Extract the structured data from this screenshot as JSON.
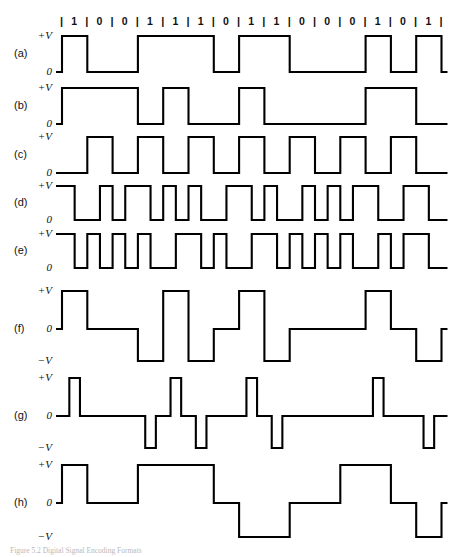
{
  "figure": {
    "caption": "Figure 5.2  Digital Signal Encoding Formats",
    "bit_sequence": [
      1,
      0,
      0,
      1,
      1,
      1,
      0,
      1,
      1,
      0,
      0,
      0,
      1,
      0,
      1
    ],
    "separator": "|",
    "ink_color": "#000000",
    "background_color": "#ffffff"
  },
  "axis_labels": {
    "plus_v": "+V",
    "zero": "0",
    "minus_v": "−V"
  },
  "waveforms": [
    {
      "key": "a",
      "name": "(a)",
      "scheme": "NRZ-L",
      "levels": [
        "+V",
        "0"
      ]
    },
    {
      "key": "b",
      "name": "(b)",
      "scheme": "NRZI",
      "levels": [
        "+V",
        "0"
      ]
    },
    {
      "key": "c",
      "name": "(c)",
      "scheme": "Bipolar-AMI",
      "levels": [
        "+V",
        "0"
      ]
    },
    {
      "key": "d",
      "name": "(d)",
      "scheme": "Manchester",
      "levels": [
        "+V",
        "0"
      ]
    },
    {
      "key": "e",
      "name": "(e)",
      "scheme": "Differential Manchester",
      "levels": [
        "+V",
        "0"
      ]
    },
    {
      "key": "f",
      "name": "(f)",
      "scheme": "Bipolar-AMI",
      "levels": [
        "+V",
        "0",
        "−V"
      ]
    },
    {
      "key": "g",
      "name": "(g)",
      "scheme": "B8ZS",
      "levels": [
        "+V",
        "0",
        "−V"
      ]
    },
    {
      "key": "h",
      "name": "(h)",
      "scheme": "HDB3",
      "levels": [
        "+V",
        "0",
        "−V"
      ]
    }
  ],
  "chart_data": {
    "type": "line",
    "title": "Digital Signal Encoding Formats",
    "xlabel": "",
    "ylabel": "",
    "grid": false,
    "legend": "none",
    "bit_sequence": [
      1,
      0,
      0,
      1,
      1,
      1,
      0,
      1,
      1,
      0,
      0,
      0,
      1,
      0,
      1
    ],
    "bit_count": 15,
    "cell_width_px": 25.3,
    "levels_two": {
      "high": "+V",
      "low": "0"
    },
    "levels_three": {
      "high": "+V",
      "mid": "0",
      "low": "−V"
    },
    "series": [
      {
        "name": "(a)",
        "encoding": "NRZ-L",
        "level_set": "two",
        "description": "High for 1, low for 0; level holds for the whole bit cell.",
        "levels_per_bit": [
          1,
          0,
          0,
          1,
          1,
          1,
          0,
          1,
          1,
          0,
          0,
          0,
          1,
          0,
          1
        ]
      },
      {
        "name": "(b)",
        "encoding": "NRZI",
        "level_set": "two",
        "description": "Transition at the start of a bit cell encodes 1; no transition encodes 0. Starts low.",
        "levels_per_bit": [
          1,
          1,
          1,
          0,
          1,
          0,
          0,
          1,
          0,
          0,
          0,
          0,
          1,
          1,
          0
        ]
      },
      {
        "name": "(c)",
        "encoding": "Bipolar-AMI (unipolar rendering)",
        "level_set": "two",
        "description": "Pulse present in alternating cells; return to zero between pulses.",
        "half_cells": [
          [
            0,
            0
          ],
          [
            1,
            1
          ],
          [
            0,
            0
          ],
          [
            1,
            1
          ],
          [
            0,
            0
          ],
          [
            1,
            1
          ],
          [
            0,
            0
          ],
          [
            1,
            1
          ],
          [
            0,
            0
          ],
          [
            1,
            1
          ],
          [
            0,
            0
          ],
          [
            1,
            1
          ],
          [
            0,
            0
          ],
          [
            1,
            1
          ],
          [
            0,
            0
          ]
        ]
      },
      {
        "name": "(d)",
        "encoding": "Manchester",
        "level_set": "two",
        "description": "Mid-bit transition: high-to-low encodes 1, low-to-high encodes 0.",
        "half_cells": [
          [
            1,
            0
          ],
          [
            0,
            1
          ],
          [
            0,
            1
          ],
          [
            1,
            0
          ],
          [
            1,
            0
          ],
          [
            1,
            0
          ],
          [
            0,
            1
          ],
          [
            1,
            0
          ],
          [
            1,
            0
          ],
          [
            0,
            1
          ],
          [
            0,
            1
          ],
          [
            0,
            1
          ],
          [
            1,
            0
          ],
          [
            0,
            1
          ],
          [
            1,
            0
          ]
        ]
      },
      {
        "name": "(e)",
        "encoding": "Differential Manchester",
        "level_set": "two",
        "description": "Always a mid-bit transition; a transition at the start of the cell encodes 0, no start transition encodes 1.",
        "half_cells": [
          [
            1,
            0
          ],
          [
            1,
            0
          ],
          [
            1,
            0
          ],
          [
            1,
            0
          ],
          [
            0,
            1
          ],
          [
            1,
            0
          ],
          [
            1,
            0
          ],
          [
            0,
            1
          ],
          [
            1,
            0
          ],
          [
            1,
            0
          ],
          [
            1,
            0
          ],
          [
            1,
            0
          ],
          [
            0,
            1
          ],
          [
            0,
            1
          ],
          [
            1,
            0
          ]
        ]
      },
      {
        "name": "(f)",
        "encoding": "Bipolar-AMI",
        "level_set": "three",
        "description": "0 encoded as no line signal; 1 encoded as alternating positive and negative pulses.",
        "levels_per_bit": [
          1,
          0,
          0,
          -1,
          1,
          -1,
          0,
          1,
          -1,
          0,
          0,
          0,
          1,
          0,
          -1
        ]
      },
      {
        "name": "(g)",
        "encoding": "B8ZS",
        "level_set": "three",
        "description": "Bipolar-AMI with return-to-zero narrow pulses and zero-substitution violations.",
        "pulses_per_bit": [
          1,
          0,
          0,
          -1,
          1,
          -1,
          0,
          1,
          -1,
          0,
          0,
          0,
          1,
          0,
          -1
        ]
      },
      {
        "name": "(h)",
        "encoding": "HDB3 / multilevel",
        "level_set": "three",
        "description": "Multilevel three-state waveform holding each level for the full bit cell.",
        "levels_per_bit": [
          1,
          0,
          0,
          1,
          1,
          1,
          0,
          -1,
          -1,
          0,
          0,
          1,
          1,
          0,
          -1
        ]
      }
    ]
  }
}
